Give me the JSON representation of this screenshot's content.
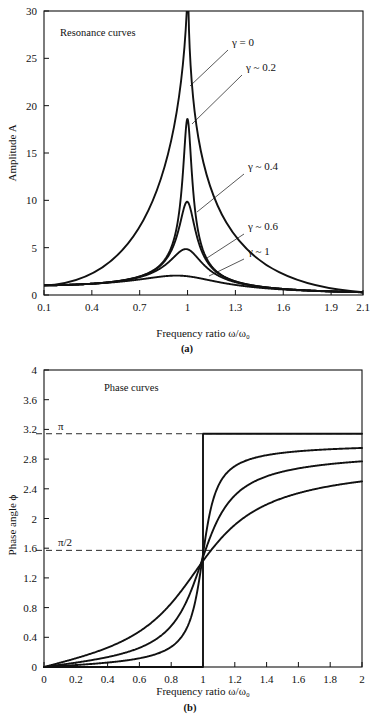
{
  "figure": {
    "panel_a_caption": "(a)",
    "panel_b_caption": "(b)"
  },
  "chart_data": [
    {
      "id": "resonance",
      "type": "line",
      "title": "Resonance curves",
      "xlabel": "Frequency ratio ω/ω₀",
      "ylabel": "Amplitude A",
      "xlim": [
        0.1,
        2.1
      ],
      "ylim": [
        0,
        30
      ],
      "xticks": [
        0.1,
        0.4,
        0.7,
        1.0,
        1.3,
        1.6,
        1.9,
        2.1
      ],
      "xtick_labels": [
        "0.1",
        "0.4",
        "0.7",
        "1",
        "1.3",
        "1.6",
        "1.9",
        "2.1"
      ],
      "yticks": [
        0,
        5,
        10,
        15,
        20,
        25,
        30
      ],
      "ytick_labels": [
        "0",
        "5",
        "10",
        "15",
        "20",
        "25",
        "30"
      ],
      "grid": false,
      "legend_position": "inline-annotations",
      "series": [
        {
          "name": "γ = 0",
          "gamma": 0.0,
          "peak": 200.0,
          "annotation": "γ = 0"
        },
        {
          "name": "γ ~ 0.2",
          "gamma": 0.054,
          "peak": 18.6,
          "annotation": "γ ~ 0.2"
        },
        {
          "name": "γ ~ 0.4",
          "gamma": 0.102,
          "peak": 9.85,
          "annotation": "γ ~ 0.4"
        },
        {
          "name": "γ ~ 0.6",
          "gamma": 0.208,
          "peak": 4.85,
          "annotation": "γ ~ 0.6"
        },
        {
          "name": "γ ~ 1",
          "gamma": 0.52,
          "peak": 2.05,
          "annotation": "γ ~ 1"
        }
      ],
      "annotations": [
        {
          "label": "γ = 0",
          "text_x": 232,
          "text_y": 46,
          "leader": [
            [
              228,
              50
            ],
            [
              190,
              86
            ]
          ]
        },
        {
          "label": "γ ~ 0.2",
          "text_x": 246,
          "text_y": 71,
          "leader": [
            [
              242,
              75
            ],
            [
              192,
              124
            ]
          ]
        },
        {
          "label": "γ ~ 0.4",
          "text_x": 248,
          "text_y": 170,
          "leader": [
            [
              244,
              174
            ],
            [
              197,
              212
            ]
          ]
        },
        {
          "label": "γ ~ 0.6",
          "text_x": 248,
          "text_y": 230,
          "leader": [
            [
              244,
              234
            ],
            [
              207,
              258
            ]
          ]
        },
        {
          "label": "γ ~ 1",
          "text_x": 248,
          "text_y": 255,
          "leader": [
            [
              244,
              259
            ],
            [
              209,
              276
            ]
          ]
        }
      ]
    },
    {
      "id": "phase",
      "type": "line",
      "title": "Phase curves",
      "xlabel": "Frequency ratio ω/ω₀",
      "ylabel": "Phase angle ϕ",
      "xlim": [
        0,
        2
      ],
      "ylim": [
        0,
        4
      ],
      "xticks": [
        0,
        0.2,
        0.4,
        0.6,
        0.8,
        1.0,
        1.2,
        1.4,
        1.6,
        1.8,
        2.0
      ],
      "xtick_labels": [
        "0",
        "0.2",
        "0.4",
        "0.6",
        "0.8",
        "1",
        "1.2",
        "1.4",
        "1.6",
        "1.8",
        "2"
      ],
      "yticks": [
        0,
        0.4,
        0.8,
        1.2,
        1.6,
        2.0,
        2.4,
        2.8,
        3.2,
        3.6,
        4.0
      ],
      "ytick_labels": [
        "0",
        "0.4",
        "0.8",
        "1.2",
        "1.6",
        "2",
        "2.4",
        "2.8",
        "3.2",
        "3.6",
        "4"
      ],
      "grid": false,
      "legend_position": "inline-annotations",
      "reference_lines": [
        {
          "label": "π",
          "value": 3.1416,
          "style": "dashed"
        },
        {
          "label": "π/2",
          "value": 1.5708,
          "style": "dashed"
        }
      ],
      "series": [
        {
          "name": "γ = 0",
          "gamma": 0.0,
          "end_value": 3.1416,
          "annotation": "γ = 0"
        },
        {
          "name": "Small γ",
          "gamma": 0.13,
          "end_value": 2.95,
          "annotation": "Small γ"
        },
        {
          "name": "mid γ",
          "gamma": 0.3,
          "end_value": 2.77,
          "annotation": ""
        },
        {
          "name": "Large γ",
          "gamma": 0.62,
          "end_value": 2.5,
          "annotation": "Large γ"
        }
      ],
      "annotations": [
        {
          "label": "γ = 0",
          "text_x": 160,
          "text_y": 457,
          "leader": [
            [
              196,
              454
            ],
            [
              212,
              468
            ]
          ]
        },
        {
          "label": "Small γ",
          "text_x": 147,
          "text_y": 480,
          "leader": [
            [
              196,
              477
            ],
            [
              215,
              497
            ]
          ]
        },
        {
          "label": "Large γ",
          "text_x": 284,
          "text_y": 526,
          "leader": [
            [
              281,
              522
            ],
            [
              258,
              505
            ]
          ]
        }
      ]
    }
  ]
}
